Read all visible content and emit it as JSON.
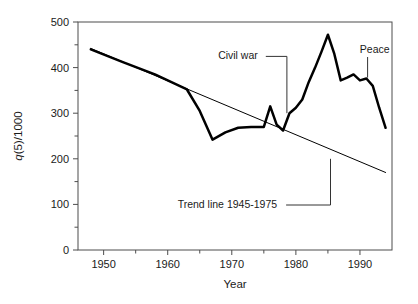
{
  "figure": {
    "background": "#ffffff",
    "line_color": "#000000",
    "axis_color": "#4d4d4d"
  },
  "chart_data": {
    "type": "line",
    "title": "",
    "xlabel": "Year",
    "ylabel": "q(5)/1000",
    "ylabel_italic_prefix": "q",
    "ylabel_rest": "(5)/1000",
    "xlim": [
      1946,
      1995
    ],
    "ylim": [
      0,
      500
    ],
    "grid": false,
    "legend": "none",
    "x_ticks_major": [
      1950,
      1960,
      1970,
      1980,
      1990
    ],
    "x_ticks_major_labels": [
      "1950",
      "1960",
      "1970",
      "1980",
      "1990"
    ],
    "x_ticks_minor": [
      1955,
      1965,
      1975,
      1985
    ],
    "y_ticks_major": [
      0,
      100,
      200,
      300,
      400,
      500
    ],
    "y_ticks_major_labels": [
      "0",
      "100",
      "200",
      "300",
      "400",
      "500"
    ],
    "y_ticks_minor": [
      50,
      150,
      250,
      350,
      450
    ],
    "series": [
      {
        "name": "q(5)/1000 observed",
        "style": "thick-solid",
        "x": [
          1948,
          1953,
          1958,
          1963,
          1965,
          1967,
          1969,
          1971,
          1973,
          1975,
          1976,
          1977,
          1978,
          1979,
          1980,
          1981,
          1982,
          1983,
          1984,
          1985,
          1986,
          1987,
          1988,
          1989,
          1990,
          1991,
          1992,
          1993,
          1994
        ],
        "y": [
          440,
          412,
          385,
          352,
          305,
          242,
          258,
          268,
          270,
          270,
          315,
          275,
          262,
          300,
          312,
          330,
          368,
          400,
          435,
          472,
          430,
          372,
          378,
          385,
          372,
          376,
          360,
          312,
          268
        ]
      },
      {
        "name": "Trend line 1945-1975",
        "style": "thin-solid",
        "x": [
          1948,
          1994
        ],
        "y": [
          442,
          170
        ]
      }
    ],
    "annotations": [
      {
        "text": "Civil war",
        "label_x": 1975.0,
        "label_y": 418,
        "target_x": 1978.6,
        "target_y": 300,
        "leader": "right-then-down"
      },
      {
        "text": "Peace",
        "label_x": 1990.6,
        "label_y": 432,
        "target_x": 1991.2,
        "target_y": 378,
        "leader": "down"
      },
      {
        "text": "Trend line 1945-1975",
        "label_x": 1978.0,
        "label_y": 92,
        "target_x": 1985.4,
        "target_y": 200,
        "leader": "right-then-up"
      }
    ]
  }
}
